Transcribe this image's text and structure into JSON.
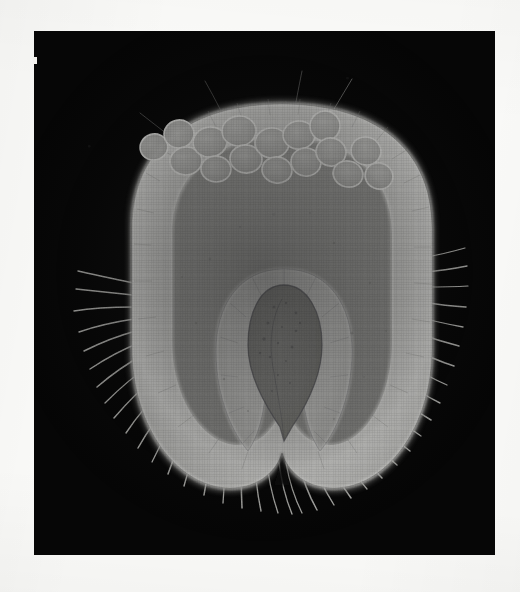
{
  "figure": {
    "domain": "Natural-Image",
    "kind": "scanned-plate-photomicrograph",
    "caption": "",
    "alt_text": "Dark-field photomicrograph of a median longitudinal section through a rounded, bristled ovule-like specimen showing an outer translucent wall, an arc of rounded cells beneath the upper wall, a U-shaped inner envelope and a dark teardrop-shaped central body.",
    "page_background": "#fbfbf9",
    "plate_background": "#060606"
  },
  "plate": {
    "x": 34,
    "y": 31,
    "width": 461,
    "height": 524,
    "edge_artifact": {
      "x": 33,
      "y": 57,
      "width": 4,
      "height": 7,
      "color": "#f2f1ee"
    }
  },
  "specimen": {
    "label": "specimen",
    "outline_fill": "#b9b9b7",
    "wall_highlight": "#e3e3e0",
    "interior_fill": "#9c9c9a",
    "core_fill": "#8a8a87",
    "bounds": {
      "x": 96,
      "y": 72,
      "width": 304,
      "height": 392
    },
    "parts": [
      {
        "name": "outer-wall",
        "description": "bright translucent outer shell / integument",
        "tone": "#d6d6d3"
      },
      {
        "name": "inner-cavity",
        "description": "mid-grey granular endosperm cavity",
        "tone": "#9c9c9a"
      },
      {
        "name": "cell-row",
        "description": "arc of rounded cells under the upper wall",
        "tone": "#c2c2bf",
        "count": 16
      },
      {
        "name": "inner-envelope",
        "description": "U-shaped bright envelope around the core",
        "tone": "#d2d2cf"
      },
      {
        "name": "central-body",
        "description": "dark teardrop-shaped central body / embryo",
        "tone": "#7e7e7b"
      },
      {
        "name": "basal-cleft",
        "description": "notch between the two basal lobes",
        "tone": "#0a0a0a"
      },
      {
        "name": "bristles",
        "description": "fine radiating setae along the lower margin",
        "tone": "#cfcfcb",
        "count": 46
      }
    ]
  },
  "cell_row": {
    "note": "approximate centres and radii of the rounded cells, in plate coordinates",
    "cells": [
      {
        "cx": 120,
        "cy": 116,
        "rx": 14,
        "ry": 13,
        "rot": -18
      },
      {
        "cx": 145,
        "cy": 103,
        "rx": 15,
        "ry": 14,
        "rot": -12
      },
      {
        "cx": 152,
        "cy": 130,
        "rx": 16,
        "ry": 14,
        "rot": -6
      },
      {
        "cx": 176,
        "cy": 111,
        "rx": 17,
        "ry": 15,
        "rot": -8
      },
      {
        "cx": 182,
        "cy": 138,
        "rx": 15,
        "ry": 13,
        "rot": 4
      },
      {
        "cx": 205,
        "cy": 100,
        "rx": 17,
        "ry": 15,
        "rot": -4
      },
      {
        "cx": 212,
        "cy": 128,
        "rx": 16,
        "ry": 14,
        "rot": 6
      },
      {
        "cx": 238,
        "cy": 112,
        "rx": 17,
        "ry": 15,
        "rot": 2
      },
      {
        "cx": 243,
        "cy": 139,
        "rx": 15,
        "ry": 13,
        "rot": 8
      },
      {
        "cx": 265,
        "cy": 104,
        "rx": 16,
        "ry": 14,
        "rot": -2
      },
      {
        "cx": 272,
        "cy": 131,
        "rx": 15,
        "ry": 14,
        "rot": 10
      },
      {
        "cx": 291,
        "cy": 95,
        "rx": 15,
        "ry": 15,
        "rot": 6
      },
      {
        "cx": 297,
        "cy": 121,
        "rx": 15,
        "ry": 14,
        "rot": 12
      },
      {
        "cx": 314,
        "cy": 143,
        "rx": 15,
        "ry": 13,
        "rot": 16
      },
      {
        "cx": 332,
        "cy": 120,
        "rx": 15,
        "ry": 14,
        "rot": 18
      },
      {
        "cx": 345,
        "cy": 145,
        "rx": 14,
        "ry": 13,
        "rot": 22
      }
    ]
  },
  "bristles": {
    "note": "radiating setae; each entry is angle in degrees measured from the specimen centre and length in px",
    "left_side": [
      184,
      190,
      196,
      202,
      208,
      214,
      220,
      226,
      232,
      238,
      244,
      250,
      256,
      262
    ],
    "bottom": [
      264,
      270,
      276,
      282,
      288,
      294,
      300,
      306,
      312,
      318
    ],
    "right_side": [
      324,
      330,
      336,
      342,
      348,
      354,
      358,
      2,
      8,
      14
    ],
    "top": [
      86,
      92,
      98
    ],
    "length_px_min": 16,
    "length_px_max": 48
  }
}
